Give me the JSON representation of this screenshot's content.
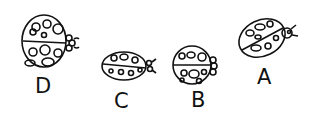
{
  "figure": {
    "ink_color": "#111111",
    "background": "#ffffff",
    "ladybugs": [
      {
        "label": "D",
        "shape": "large round body, head facing right"
      },
      {
        "label": "C",
        "shape": "elongated oval body, head facing right"
      },
      {
        "label": "B",
        "shape": "round body, head facing right"
      },
      {
        "label": "A",
        "shape": "oval body tilted, head facing upper right"
      }
    ]
  }
}
